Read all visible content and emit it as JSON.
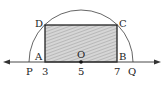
{
  "diagram": {
    "type": "geometry-number-line",
    "points": {
      "P": "P",
      "A": "A",
      "O": "O",
      "B": "B",
      "Q": "Q",
      "C": "C",
      "D": "D"
    },
    "ticks": [
      "3",
      "5",
      "7"
    ],
    "shapes": {
      "semicircle": {
        "center": "O",
        "center_value": 5
      },
      "rectangle": {
        "vertices": [
          "A",
          "B",
          "C",
          "D"
        ],
        "fill": "hatched-gray"
      }
    },
    "colors": {
      "line": "#333333",
      "fill": "#bdbdbd"
    }
  }
}
